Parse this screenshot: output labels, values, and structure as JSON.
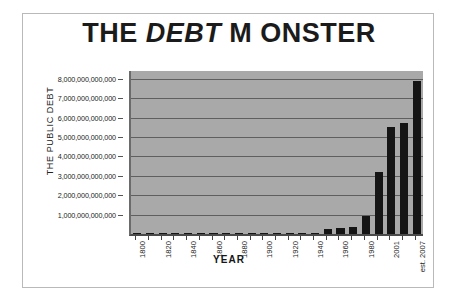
{
  "chart_data": {
    "type": "bar",
    "title_parts": {
      "prefix": "THE ",
      "emphasis": "DEBT",
      "suffix": " M ONSTER"
    },
    "title": "THE DEBT M ONSTER",
    "xlabel": "YEAR",
    "ylabel": "THE PUBLIC DEBT",
    "ylim": [
      0,
      8400000000000
    ],
    "grid": true,
    "legend": "none",
    "y_ticks": [
      1000000000000,
      2000000000000,
      3000000000000,
      4000000000000,
      5000000000000,
      6000000000000,
      7000000000000,
      8000000000000
    ],
    "y_tick_labels": [
      "1,000,000,000,000",
      "2,000,000,000,000",
      "3,000,000,000,000",
      "4,000,000,000,000",
      "5,000,000,000,000",
      "6,000,000,000,000",
      "7,000,000,000,000",
      "8,000,000,000,000"
    ],
    "x_tick_labels": [
      "1800",
      "1820",
      "1840",
      "1860",
      "1880",
      "1900",
      "1920",
      "1940",
      "1960",
      "1980",
      "2001",
      "est. 2007"
    ],
    "categories": [
      "1800",
      "1810",
      "1820",
      "1830",
      "1840",
      "1850",
      "1860",
      "1870",
      "1880",
      "1890",
      "1900",
      "1910",
      "1920",
      "1930",
      "1940",
      "1950",
      "1960",
      "1970",
      "1980",
      "1990",
      "2001",
      "2004",
      "2007"
    ],
    "values": [
      83000000000,
      53000000000,
      90000000000,
      39000000000,
      5000000000,
      63000000000,
      65000000000,
      2400000000000,
      2000000000000,
      1100000000000,
      1200000000000,
      1100000000000,
      24000000000000,
      16000000000000,
      43000000000000,
      257000000000000,
      286000000000000,
      371000000000000,
      908000000000000,
      3200000000000,
      5800000000000,
      7400000000000,
      8000000000000
    ],
    "bar_heights_trillions": [
      8e-05,
      5e-05,
      9e-05,
      4e-05,
      5e-06,
      6e-05,
      7e-05,
      0.0024,
      0.002,
      0.0011,
      0.0012,
      0.0011,
      0.024,
      0.016,
      0.043,
      0.257,
      0.286,
      0.371,
      0.908,
      3.2,
      5.5,
      5.7,
      7.9
    ],
    "colors": {
      "bar": "#151515",
      "plot_background": "#a9a9a9",
      "gridline": "#5f5f5f",
      "axis": "#4a4a4a",
      "frame": "#b9b9b9",
      "page_background": "#ffffff",
      "text": "#1b1b1b"
    }
  }
}
